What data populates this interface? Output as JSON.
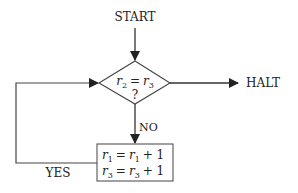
{
  "diagram": {
    "type": "flowchart",
    "colors": {
      "stroke": "#333333",
      "text": "#222222",
      "background": "#ffffff"
    },
    "nodes": {
      "start": {
        "label": "START"
      },
      "decision": {
        "line1_a": "r",
        "line1_a_sub": "2",
        "line1_eq": "=",
        "line1_b": "r",
        "line1_b_sub": "3",
        "line2": "?"
      },
      "halt": {
        "label": "HALT"
      },
      "process": {
        "line1": {
          "lhs": "r",
          "lhs_sub": "1",
          "eq": "=",
          "rhs": "r",
          "rhs_sub": "1",
          "op": "+ 1"
        },
        "line2": {
          "lhs": "r",
          "lhs_sub": "3",
          "eq": "=",
          "rhs": "r",
          "rhs_sub": "3",
          "op": "+ 1"
        }
      }
    },
    "edges": {
      "no_label": "NO",
      "yes_label": "YES"
    }
  }
}
